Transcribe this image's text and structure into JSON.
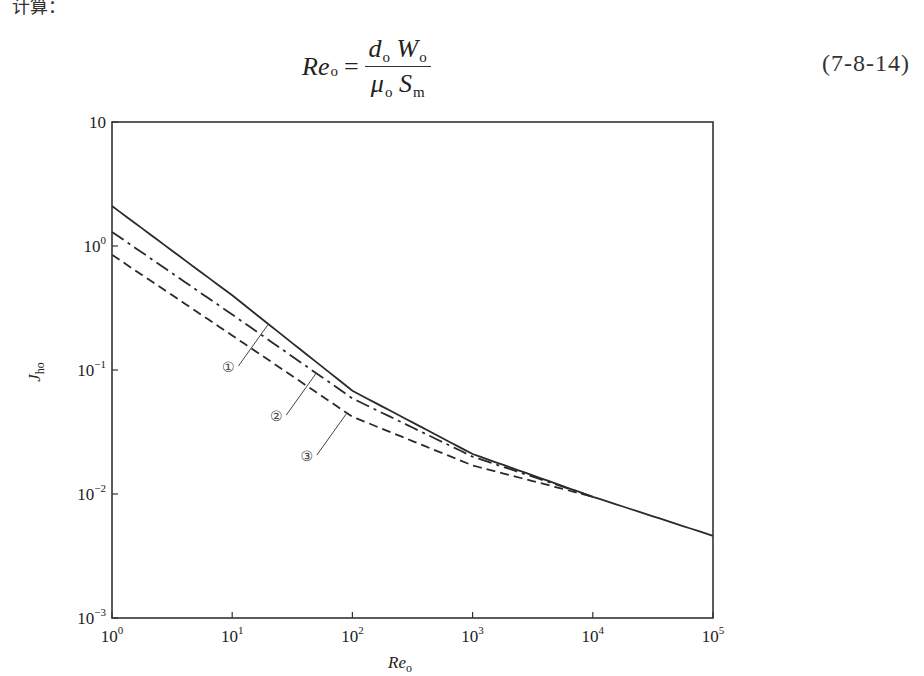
{
  "page": {
    "top_fragment": "计算：",
    "formula": {
      "lhs": "Re",
      "lhs_sub": "o",
      "numerator": [
        {
          "sym": "d",
          "sub": "o"
        },
        {
          "sym": "W",
          "sub": "o"
        }
      ],
      "denominator": [
        {
          "sym": "μ",
          "sub": "o"
        },
        {
          "sym": "S",
          "sub": "m"
        }
      ]
    },
    "equation_number": "(7-8-14)"
  },
  "chart_data": {
    "type": "line",
    "title": "",
    "xlabel": "Re_o",
    "ylabel": "J_ho",
    "xscale": "log",
    "yscale": "log",
    "xlim": [
      1,
      100000
    ],
    "ylim": [
      0.001,
      10
    ],
    "x_ticks": [
      {
        "value": 1,
        "base": "10",
        "exp": "0"
      },
      {
        "value": 10,
        "base": "10",
        "exp": "1"
      },
      {
        "value": 100,
        "base": "10",
        "exp": "2"
      },
      {
        "value": 1000,
        "base": "10",
        "exp": "3"
      },
      {
        "value": 10000,
        "base": "10",
        "exp": "4"
      },
      {
        "value": 100000,
        "base": "10",
        "exp": "5"
      }
    ],
    "y_ticks": [
      {
        "value": 10,
        "base": "10",
        "exp": ""
      },
      {
        "value": 1,
        "base": "10",
        "exp": "0"
      },
      {
        "value": 0.1,
        "base": "10",
        "exp": "−1"
      },
      {
        "value": 0.01,
        "base": "10",
        "exp": "−2"
      },
      {
        "value": 0.001,
        "base": "10",
        "exp": "−3"
      }
    ],
    "grid": false,
    "legend": "callout labels ①②③ on curves",
    "series": [
      {
        "name": "①",
        "style": "solid",
        "x": [
          1,
          10,
          100,
          1000,
          10000,
          100000
        ],
        "values": [
          2.1,
          0.4,
          0.068,
          0.021,
          0.0095,
          0.0046
        ]
      },
      {
        "name": "②",
        "style": "dash-dot",
        "x": [
          1,
          10,
          100,
          1000,
          10000
        ],
        "values": [
          1.3,
          0.28,
          0.059,
          0.02,
          0.0095
        ]
      },
      {
        "name": "③",
        "style": "dashed",
        "x": [
          1,
          10,
          100,
          1000,
          10000
        ],
        "values": [
          0.85,
          0.19,
          0.042,
          0.017,
          0.0095
        ]
      }
    ],
    "callouts": [
      {
        "label": "①",
        "series": 0,
        "at_x": 20
      },
      {
        "label": "②",
        "series": 1,
        "at_x": 50
      },
      {
        "label": "③",
        "series": 2,
        "at_x": 90
      }
    ]
  }
}
